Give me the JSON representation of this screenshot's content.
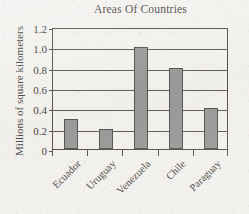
{
  "chart_data": {
    "type": "bar",
    "title": "Areas Of Countries",
    "xlabel": "",
    "ylabel": "Millions of square kilometers",
    "categories": [
      "Ecuador",
      "Uruguay",
      "Venezuela",
      "Chile",
      "Paraguay"
    ],
    "values": [
      0.3,
      0.2,
      1.0,
      0.8,
      0.4
    ],
    "ylim": [
      0,
      1.2
    ],
    "ytick_labels": [
      "0",
      "0.2",
      "0.4",
      "0.6",
      "0.8",
      "1.0",
      "1.2"
    ],
    "ytick_values": [
      0,
      0.2,
      0.4,
      0.6,
      0.8,
      1.0,
      1.2
    ],
    "grid": "horizontal",
    "legend": "none",
    "bar_color": "#8a8a8a",
    "bar_edge_color": "#3c3a38",
    "axis_color": "#3a3734",
    "background_color": "#f3f1ee",
    "text_color": "#262320",
    "x_label_rotation": -45
  }
}
